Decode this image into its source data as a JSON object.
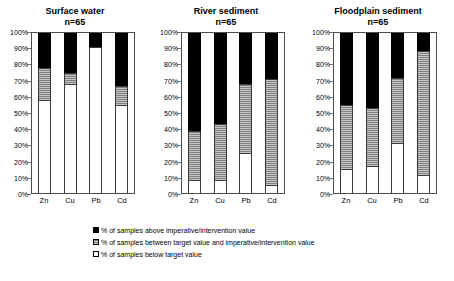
{
  "chart_data": [
    {
      "type": "bar",
      "title": "Surface water",
      "subtitle": "n=65",
      "xlabel": "",
      "ylabel": "",
      "ylim": [
        0,
        100
      ],
      "grid": false,
      "stacked": true,
      "legend_position": "bottom",
      "categories": [
        "Zn",
        "Cu",
        "Pb",
        "Cd"
      ],
      "ytick_labels": [
        "100%",
        "90%",
        "80%",
        "70%",
        "60%",
        "50%",
        "40%",
        "30%",
        "20%",
        "10%",
        "0%"
      ],
      "ytick_values": [
        100,
        90,
        80,
        70,
        60,
        50,
        40,
        30,
        20,
        10,
        0
      ],
      "series": [
        {
          "name": "% of samples below target value",
          "color": "#ffffff",
          "values": [
            58,
            68,
            91,
            55
          ]
        },
        {
          "name": "% of samples between target value and imperative/intervention value",
          "color": "#808080",
          "values": [
            20,
            7,
            0,
            12
          ]
        },
        {
          "name": "% of samples above imperative/intervention value",
          "color": "#000000",
          "values": [
            22,
            25,
            9,
            33
          ]
        }
      ]
    },
    {
      "type": "bar",
      "title": "River sediment",
      "subtitle": "n=65",
      "xlabel": "",
      "ylabel": "",
      "ylim": [
        0,
        100
      ],
      "grid": false,
      "stacked": true,
      "legend_position": "bottom",
      "categories": [
        "Zn",
        "Cu",
        "Pb",
        "Cd"
      ],
      "ytick_labels": [
        "100%",
        "90%",
        "80%",
        "70%",
        "60%",
        "50%",
        "40%",
        "30%",
        "20%",
        "10%",
        "0%"
      ],
      "ytick_values": [
        100,
        90,
        80,
        70,
        60,
        50,
        40,
        30,
        20,
        10,
        0
      ],
      "series": [
        {
          "name": "% of samples below target value",
          "color": "#ffffff",
          "values": [
            8,
            8,
            25,
            5
          ]
        },
        {
          "name": "% of samples between target value and imperative/intervention value",
          "color": "#808080",
          "values": [
            31,
            35,
            43,
            66
          ]
        },
        {
          "name": "% of samples above imperative/intervention value",
          "color": "#000000",
          "values": [
            61,
            57,
            32,
            29
          ]
        }
      ]
    },
    {
      "type": "bar",
      "title": "Floodplain sediment",
      "subtitle": "n=65",
      "xlabel": "",
      "ylabel": "",
      "ylim": [
        0,
        100
      ],
      "grid": false,
      "stacked": true,
      "legend_position": "bottom",
      "categories": [
        "Zn",
        "Cu",
        "Pb",
        "Cd"
      ],
      "ytick_labels": [
        "100%",
        "90%",
        "80%",
        "70%",
        "60%",
        "50%",
        "40%",
        "30%",
        "20%",
        "10%",
        "0%"
      ],
      "ytick_values": [
        100,
        90,
        80,
        70,
        60,
        50,
        40,
        30,
        20,
        10,
        0
      ],
      "series": [
        {
          "name": "% of samples below target value",
          "color": "#ffffff",
          "values": [
            15,
            17,
            31,
            11
          ]
        },
        {
          "name": "% of samples between target value and imperative/intervention value",
          "color": "#808080",
          "values": [
            40,
            36,
            41,
            78
          ]
        },
        {
          "name": "% of samples above imperative/intervention value",
          "color": "#000000",
          "values": [
            45,
            47,
            28,
            11
          ]
        }
      ]
    }
  ],
  "panels": [
    {
      "title": "Surface water",
      "subtitle": "n=65",
      "ticks": [
        "100%",
        "90%",
        "80%",
        "70%",
        "60%",
        "50%",
        "40%",
        "30%",
        "20%",
        "10%",
        "0%"
      ],
      "bars": [
        {
          "label": "Zn",
          "below": 58,
          "between": 20,
          "above": 22
        },
        {
          "label": "Cu",
          "below": 68,
          "between": 7,
          "above": 25
        },
        {
          "label": "Pb",
          "below": 91,
          "between": 0,
          "above": 9
        },
        {
          "label": "Cd",
          "below": 55,
          "between": 12,
          "above": 33
        }
      ]
    },
    {
      "title": "River sediment",
      "subtitle": "n=65",
      "ticks": [
        "100%",
        "90%",
        "80%",
        "70%",
        "60%",
        "50%",
        "40%",
        "30%",
        "20%",
        "10%",
        "0%"
      ],
      "bars": [
        {
          "label": "Zn",
          "below": 8,
          "between": 31,
          "above": 61
        },
        {
          "label": "Cu",
          "below": 8,
          "between": 35,
          "above": 57
        },
        {
          "label": "Pb",
          "below": 25,
          "between": 43,
          "above": 32
        },
        {
          "label": "Cd",
          "below": 5,
          "between": 66,
          "above": 29
        }
      ]
    },
    {
      "title": "Floodplain sediment",
      "subtitle": "n=65",
      "ticks": [
        "100%",
        "90%",
        "80%",
        "70%",
        "60%",
        "50%",
        "40%",
        "30%",
        "20%",
        "10%",
        "0%"
      ],
      "bars": [
        {
          "label": "Zn",
          "below": 15,
          "between": 40,
          "above": 45
        },
        {
          "label": "Cu",
          "below": 17,
          "between": 36,
          "above": 47
        },
        {
          "label": "Pb",
          "below": 31,
          "between": 41,
          "above": 28
        },
        {
          "label": "Cd",
          "below": 11,
          "between": 78,
          "above": 11
        }
      ]
    }
  ],
  "legend": {
    "items": [
      {
        "swatch": "above",
        "label": "% of samples above imperative/intervention value"
      },
      {
        "swatch": "between",
        "label": "% of samples between target value and imperative/intervention value"
      },
      {
        "swatch": "below",
        "label": "% of samples below target value"
      }
    ]
  },
  "colors": {
    "above": "#000000",
    "between": "#808080",
    "below": "#ffffff",
    "axis": "#4d4d4d"
  }
}
